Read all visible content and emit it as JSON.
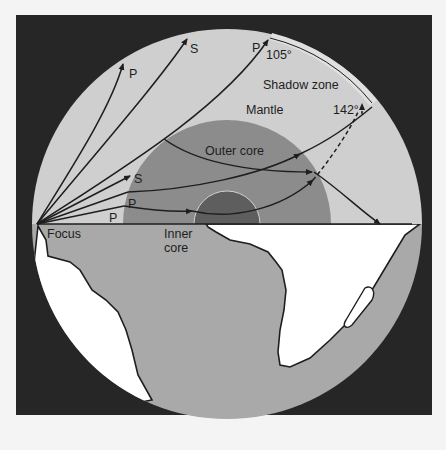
{
  "figure": {
    "colors": {
      "background": "#262626",
      "mantle": "#cfcfcf",
      "outer_core": "#8c8c8c",
      "inner_core": "#5e5e5e",
      "lower_hemisphere": "#a9a9a9",
      "continents": "#ffffff",
      "ray": "#1e1e1e"
    }
  },
  "labels": {
    "mantle": "Mantle",
    "outer_core": "Outer core",
    "inner_core_line1": "Inner",
    "inner_core_line2": "core",
    "focus": "Focus",
    "shadow_zone": "Shadow zone",
    "angle_105": "105°",
    "angle_142": "142°"
  },
  "rays": [
    {
      "type": "P",
      "label": "P",
      "path": "upper-left shallow"
    },
    {
      "type": "S",
      "label": "S",
      "path": "upper mid"
    },
    {
      "type": "P",
      "label": "P",
      "path": "grazing core to 105°"
    },
    {
      "type": "S",
      "label": "S",
      "path": "enters outer core"
    },
    {
      "type": "P",
      "label": "P",
      "path": "refracted through outer core"
    },
    {
      "type": "P",
      "label": "P",
      "path": "through inner core to 142°"
    }
  ]
}
